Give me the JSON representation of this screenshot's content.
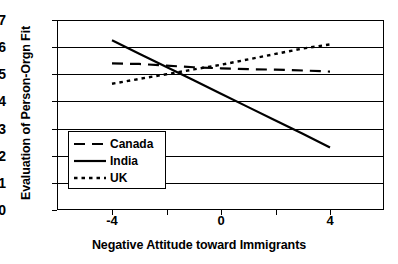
{
  "chart_data": {
    "type": "line",
    "title": "",
    "xlabel": "Negative Attitude toward Immigrants",
    "ylabel": "Evaluation of Person-Orgn Fit",
    "xlim": [
      -6,
      6
    ],
    "ylim": [
      0,
      7
    ],
    "xticks": [
      -4,
      0,
      4
    ],
    "xticklabels": [
      "-4",
      "0",
      "4"
    ],
    "yticks": [
      0,
      1,
      2,
      3,
      4,
      5,
      6,
      7
    ],
    "yticklabels": [
      "0",
      "1",
      "2",
      "3",
      "4",
      "5",
      "6",
      "7"
    ],
    "grid": "horizontal",
    "legend_position": "lower-left-inside",
    "x": [
      -4,
      -3,
      -2,
      -1,
      0,
      1,
      2,
      3,
      4
    ],
    "series": [
      {
        "name": "Canada",
        "style": "dashed",
        "color": "#000000",
        "values": [
          5.4,
          5.38,
          5.32,
          5.26,
          5.22,
          5.19,
          5.17,
          5.14,
          5.1
        ]
      },
      {
        "name": "India",
        "style": "solid",
        "color": "#000000",
        "values": [
          6.25,
          5.76,
          5.27,
          4.78,
          4.28,
          3.79,
          3.3,
          2.81,
          2.3
        ]
      },
      {
        "name": "UK",
        "style": "dotted",
        "color": "#000000",
        "values": [
          4.65,
          4.83,
          5.0,
          5.18,
          5.35,
          5.55,
          5.75,
          5.95,
          6.1
        ]
      }
    ]
  },
  "legend": {
    "items": [
      {
        "label": "Canada",
        "style": "dashed"
      },
      {
        "label": "India",
        "style": "solid"
      },
      {
        "label": "UK",
        "style": "dotted"
      }
    ]
  }
}
